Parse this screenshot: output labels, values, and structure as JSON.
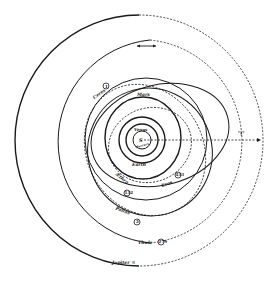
{
  "diagram": {
    "colors": {
      "ink": "#1a1a1a",
      "background": "#ffffff"
    },
    "center": {
      "symbol": "S",
      "label": "Sun"
    },
    "direction_arrow": "double-headed arrow (direction of motion)",
    "equinox_symbol": "♈",
    "labels": {
      "mercury": "Mercury",
      "venus": "Venus",
      "earth": "Earth",
      "mars": "Mars",
      "ceres": "Ceres",
      "eros": "Eros",
      "aethra": "Æthra",
      "pallas": "Pallas",
      "thule": "Thule",
      "jupiter": "Jupiter ♃"
    },
    "asteroid_numbers": {
      "ceres": "1",
      "eros": "433",
      "aethra": "132",
      "pallas": "2",
      "thule": "279"
    }
  }
}
